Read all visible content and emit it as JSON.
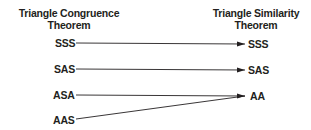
{
  "left_header": {
    "line1": "Triangle Congruence",
    "line2": "Theorem"
  },
  "right_header": {
    "line1": "Triangle Similarity",
    "line2": "Theorem"
  },
  "left_items": [
    "SSS",
    "SAS",
    "ASA",
    "AAS"
  ],
  "right_items": [
    "SSS",
    "SAS",
    "AA"
  ],
  "mappings": [
    {
      "from": "SSS",
      "to": "SSS"
    },
    {
      "from": "SAS",
      "to": "SAS"
    },
    {
      "from": "ASA",
      "to": "AA"
    },
    {
      "from": "AAS",
      "to": "AA"
    }
  ],
  "colors": {
    "text": "#231f20",
    "line": "#231f20"
  }
}
